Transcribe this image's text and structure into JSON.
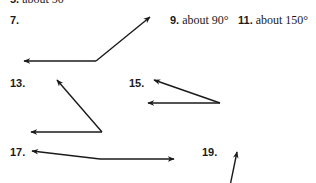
{
  "answers": {
    "item5": {
      "number": "5.",
      "text": "about 50"
    },
    "item9": {
      "number": "9.",
      "text": "about 90°"
    },
    "item11": {
      "number": "11.",
      "text": "about 150°"
    }
  },
  "figures": {
    "item7": {
      "number": "7."
    },
    "item13": {
      "number": "13."
    },
    "item15": {
      "number": "15."
    },
    "item17": {
      "number": "17."
    },
    "item19": {
      "number": "19."
    }
  },
  "colors": {
    "ink": "#1a1a1a",
    "background": "#ffffff"
  }
}
